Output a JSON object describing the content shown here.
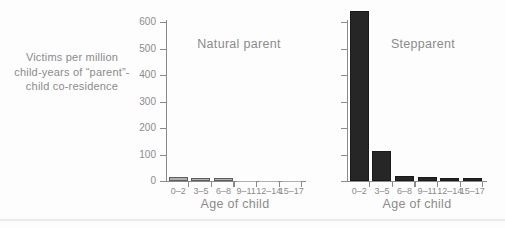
{
  "figure": {
    "y_axis_title": "Victims per million\nchild-years of “parent”-\nchild co-residence"
  },
  "colors": {
    "axis": "#8a8a8a",
    "text": "#8b8b8b",
    "natural_bar_fill": "#afafaf",
    "natural_bar_border": "#5e5e5e",
    "step_bar_fill": "#262626",
    "step_bar_border": "#1a1a1a",
    "page_line": "#eaeaea",
    "background": "#fdfdfd"
  },
  "chart_data": [
    {
      "type": "bar",
      "title": "Natural parent",
      "categories": [
        "0–2",
        "3–5",
        "6–8",
        "9–11",
        "12–14",
        "15–17"
      ],
      "values": [
        15,
        12,
        10,
        1,
        1,
        1
      ],
      "xlabel": "Age of child",
      "ylabel": "Victims per million child-years of “parent”-child co-residence",
      "ylim": [
        0,
        600
      ],
      "yticks": [
        0,
        100,
        200,
        300,
        400,
        500,
        600
      ],
      "show_y_tick_labels": true,
      "grid": false,
      "legend": "none",
      "bar_color": "#afafaf",
      "bar_border": "#5e5e5e"
    },
    {
      "type": "bar",
      "title": "Stepparent",
      "categories": [
        "0–2",
        "3–5",
        "6–8",
        "9–11",
        "12–14",
        "15–17"
      ],
      "values": [
        640,
        115,
        18,
        14,
        12,
        10
      ],
      "xlabel": "Age of child",
      "ylabel": "Victims per million child-years of “parent”-child co-residence",
      "ylim": [
        0,
        600
      ],
      "yticks": [
        0,
        100,
        200,
        300,
        400,
        500,
        600
      ],
      "show_y_tick_labels": false,
      "grid": false,
      "legend": "none",
      "bar_color": "#262626",
      "bar_border": "#1a1a1a"
    }
  ]
}
